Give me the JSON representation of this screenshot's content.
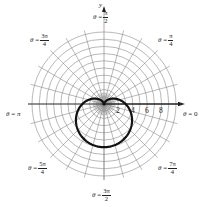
{
  "chart_data": {
    "type": "line",
    "title": "",
    "coordinate_system": "polar",
    "equation": "r = 3 - 3 sin(theta)",
    "curve": {
      "name": "cardioid",
      "a": 3,
      "theta_range": [
        0,
        6.2832
      ],
      "points": [
        {
          "theta": 0,
          "r": 3
        },
        {
          "theta": 0.7854,
          "r": 0.88
        },
        {
          "theta": 1.5708,
          "r": 0
        },
        {
          "theta": 2.3562,
          "r": 0.88
        },
        {
          "theta": 3.1416,
          "r": 3
        },
        {
          "theta": 3.927,
          "r": 5.12
        },
        {
          "theta": 4.7124,
          "r": 6
        },
        {
          "theta": 5.4978,
          "r": 5.12
        }
      ]
    },
    "grid": {
      "on": true,
      "circles": [
        1,
        2,
        3,
        4,
        5,
        6,
        7,
        8,
        9,
        10
      ],
      "radial_step_deg": 15
    },
    "polar_axis_ticks": [
      "2",
      "4",
      "6",
      "8"
    ],
    "xlabel": "",
    "ylabel": "y",
    "angle_labels": [
      {
        "deg": 90,
        "text": "θ = π/2"
      },
      {
        "deg": 45,
        "text": "θ = π/4"
      },
      {
        "deg": 0,
        "text": "θ = 0"
      },
      {
        "deg": 315,
        "text": "θ = 7π/4"
      },
      {
        "deg": 270,
        "text": "θ = 3π/2"
      },
      {
        "deg": 225,
        "text": "θ = 5π/4"
      },
      {
        "deg": 180,
        "text": "θ = π"
      },
      {
        "deg": 135,
        "text": "θ = 3π/4"
      }
    ],
    "rlim": [
      0,
      10
    ]
  },
  "labels": {
    "y_axis": "y",
    "theta": "θ",
    "eq": "=",
    "pi": "π",
    "top": {
      "num": "π",
      "den": "2"
    },
    "top_right": {
      "num": "π",
      "den": "4"
    },
    "top_left": {
      "num": "3π",
      "den": "4"
    },
    "left": "π",
    "right": "0",
    "bottom_left": {
      "num": "5π",
      "den": "4"
    },
    "bottom_right": {
      "num": "7π",
      "den": "4"
    },
    "bottom": {
      "num": "3π",
      "den": "2"
    }
  },
  "ticks": [
    "2",
    "4",
    "6",
    "8"
  ],
  "colors": {
    "grid": "#8a8a8a",
    "axis": "#222222",
    "curve": "#111111"
  }
}
